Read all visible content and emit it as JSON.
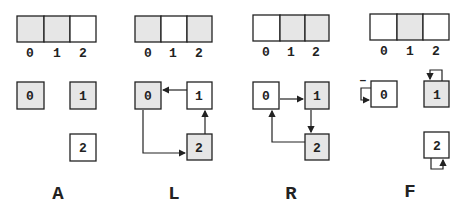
{
  "colors": {
    "shaded": "#e6e6e6",
    "plain": "#ffffff",
    "stroke": "#222222"
  },
  "panels": [
    {
      "label": "A",
      "array_indices": [
        "0",
        "1",
        "2"
      ],
      "array_shaded": [
        true,
        true,
        false
      ],
      "array_bold": 0,
      "nodes": [
        {
          "id": "0",
          "shaded": true,
          "bold": true
        },
        {
          "id": "1",
          "shaded": true,
          "bold": false
        },
        {
          "id": "2",
          "shaded": false,
          "bold": false
        }
      ],
      "edges": []
    },
    {
      "label": "L",
      "array_indices": [
        "0",
        "1",
        "2"
      ],
      "array_shaded": [
        true,
        false,
        true
      ],
      "array_bold": 0,
      "nodes": [
        {
          "id": "0",
          "shaded": true,
          "bold": true
        },
        {
          "id": "1",
          "shaded": false,
          "bold": false
        },
        {
          "id": "2",
          "shaded": true,
          "bold": false
        }
      ],
      "edges": [
        {
          "from": "1",
          "to": "0"
        },
        {
          "from": "0",
          "to": "2"
        },
        {
          "from": "2",
          "to": "1"
        }
      ]
    },
    {
      "label": "R",
      "array_indices": [
        "0",
        "1",
        "2"
      ],
      "array_shaded": [
        false,
        true,
        true
      ],
      "array_bold": 0,
      "nodes": [
        {
          "id": "0",
          "shaded": false,
          "bold": true
        },
        {
          "id": "1",
          "shaded": true,
          "bold": false
        },
        {
          "id": "2",
          "shaded": true,
          "bold": false
        }
      ],
      "edges": [
        {
          "from": "0",
          "to": "1"
        },
        {
          "from": "1",
          "to": "2"
        },
        {
          "from": "2",
          "to": "0"
        }
      ]
    },
    {
      "label": "F",
      "array_indices": [
        "0",
        "1",
        "2"
      ],
      "array_shaded": [
        false,
        true,
        false
      ],
      "array_bold": 0,
      "nodes": [
        {
          "id": "0",
          "shaded": false,
          "bold": true
        },
        {
          "id": "1",
          "shaded": true,
          "bold": false
        },
        {
          "id": "2",
          "shaded": false,
          "bold": false
        }
      ],
      "edges": [
        {
          "from": "0",
          "to": "0"
        },
        {
          "from": "1",
          "to": "1"
        },
        {
          "from": "2",
          "to": "2"
        }
      ],
      "annotation": "–"
    }
  ]
}
